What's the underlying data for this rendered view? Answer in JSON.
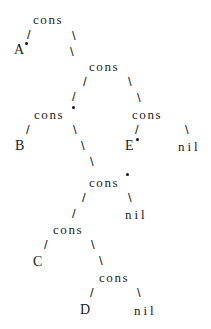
{
  "diagram": {
    "type": "cons-cell tree",
    "nodes": {
      "n1": "cons",
      "n2": "cons",
      "n3": "cons",
      "n4": "cons",
      "n5": "cons",
      "n6": "cons",
      "n7": "cons"
    },
    "leaves": {
      "A": "A",
      "B": "B",
      "C": "C",
      "D": "D",
      "E": "E",
      "nil1": "nil",
      "nil2": "nil",
      "nil3": "nil"
    },
    "edges": {
      "left": "/",
      "right": "\\"
    },
    "structure": "(cons A (cons (cons B (cons (cons C (cons D nil)) nil)) (cons E nil)))"
  }
}
